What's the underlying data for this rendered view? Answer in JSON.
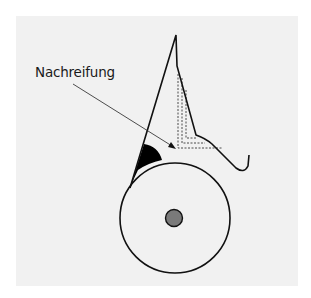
{
  "diagram": {
    "label": "Nachreifung",
    "colors": {
      "background": "#ffffff",
      "panel": "#f1f1f1",
      "stroke": "#111111",
      "filled_wedge": "#000000",
      "axle": "#7a7a7a"
    }
  }
}
